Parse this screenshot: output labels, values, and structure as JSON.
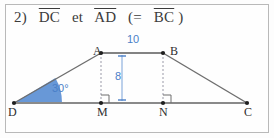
{
  "figure": {
    "header": {
      "number": "2)",
      "text_segments": [
        "DC",
        "et",
        "AD",
        "(=",
        "BC",
        ")"
      ],
      "full_text": "2) DC et AD (= BC)"
    },
    "shape_type": "trapezoid",
    "points": [
      {
        "name": "A",
        "label": "A",
        "x": 101,
        "y": 53
      },
      {
        "name": "B",
        "label": "B",
        "x": 163,
        "y": 53
      },
      {
        "name": "C",
        "label": "C",
        "x": 247,
        "y": 103
      },
      {
        "name": "D",
        "label": "D",
        "x": 14,
        "y": 103
      },
      {
        "name": "M",
        "label": "M",
        "x": 101,
        "y": 103
      },
      {
        "name": "N",
        "label": "N",
        "x": 163,
        "y": 103
      }
    ],
    "measurements": [
      {
        "name": "top-side-length",
        "label": "10",
        "segment": "AB"
      },
      {
        "name": "height",
        "label": "8",
        "segment": "AM"
      },
      {
        "name": "base-angle",
        "label": "30°",
        "vertex": "D"
      }
    ],
    "right_angles": [
      "M",
      "N"
    ],
    "colors": {
      "accent": "#4a7fc8",
      "wedge_fill": "#5b8fd4",
      "stroke": "#6e6e6e",
      "baseline": "#8a8a8a",
      "dashed": "#9a9aa8",
      "border": "#b9b9b9",
      "text": "#3b3b3b"
    }
  }
}
